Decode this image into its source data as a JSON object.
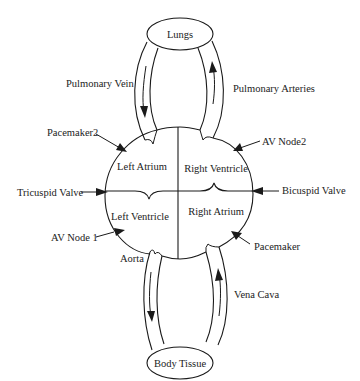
{
  "diagram": {
    "type": "circulatory-system",
    "colors": {
      "line": "#1a1a1a",
      "text": "#222222",
      "background": "#ffffff"
    },
    "organs": {
      "lungs": "Lungs",
      "body_tissue": "Body Tissue"
    },
    "chambers": {
      "left_atrium": "Left Atrium",
      "right_ventricle": "Right Ventricle",
      "left_ventricle": "Left Ventricle",
      "right_atrium": "Right Atrium"
    },
    "vessels": {
      "pulmonary_vein": "Pulmonary Vein",
      "pulmonary_arteries": "Pulmonary Arteries",
      "aorta": "Aorta",
      "vena_cava": "Vena Cava"
    },
    "callouts": {
      "pacemaker2": "Pacemaker2",
      "av_node2": "AV Node2",
      "tricuspid_valve": "Tricuspid Valve",
      "bicuspid_valve": "Bicuspid Valve",
      "av_node1": "AV Node 1",
      "pacemaker": "Pacemaker"
    },
    "flows": [
      {
        "from": "Lungs",
        "to": "Left Atrium",
        "via": "Pulmonary Vein",
        "direction": "down"
      },
      {
        "from": "Right Ventricle",
        "to": "Lungs",
        "via": "Pulmonary Arteries",
        "direction": "up"
      },
      {
        "from": "Left Ventricle",
        "to": "Body Tissue",
        "via": "Aorta",
        "direction": "down"
      },
      {
        "from": "Body Tissue",
        "to": "Right Atrium",
        "via": "Vena Cava",
        "direction": "up"
      }
    ]
  }
}
